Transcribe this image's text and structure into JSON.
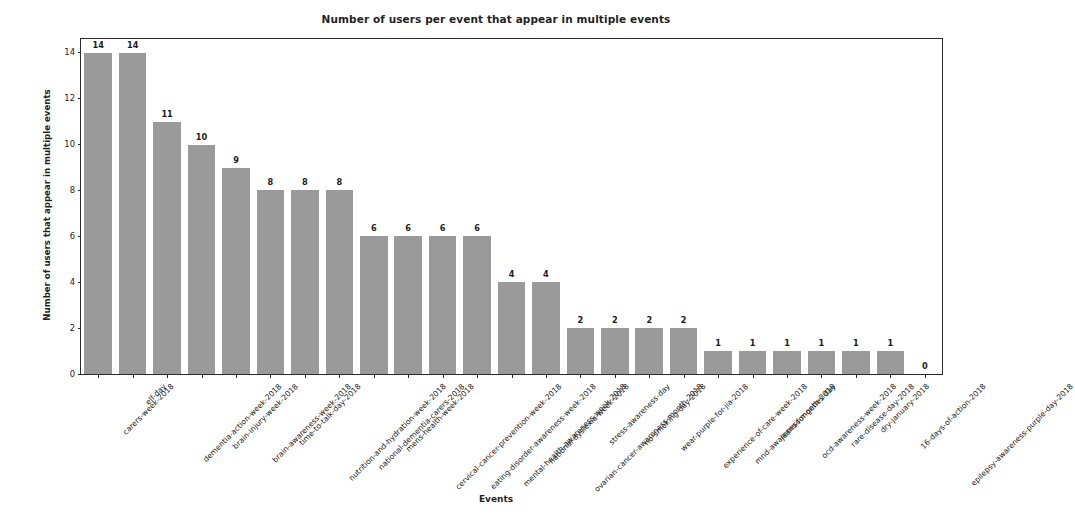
{
  "chart_data": {
    "type": "bar",
    "title": "Number of users per event that appear in multiple events",
    "xlabel": "Events",
    "ylabel": "Number of users that appear in multiple events",
    "ylim": [
      0,
      14.6
    ],
    "yticks": [
      0,
      2,
      4,
      6,
      8,
      10,
      12,
      14
    ],
    "grid": false,
    "legend": null,
    "bar_color": "#9a9a9a",
    "categories": [
      "carers-week-2018",
      "elf-day",
      "dementia-action-week-2018",
      "brain-injury-week-2018",
      "brain-awareness-week-2018",
      "time-to-talk-day-2018",
      "nutrition-and-hydration-week-2018",
      "national-dementia-carers-2018",
      "mens-health-week-2018",
      "cervical-cancer-prevention-week-2018",
      "eating-disorder-awareness-week-2018",
      "mental-health-awareness-week-2018",
      "national-dyslexia-week-2018",
      "ovarian-cancer-awareness-month-2018",
      "stress-awareness-day",
      "no-smoking-day-2018",
      "wear-purple-for-jia-2018",
      "experience-of-care-week-2018",
      "mnd-awareness-month-2018",
      "jeans-for-genes-day",
      "ocd-awareness-week-2018",
      "rare-disease-day-2018",
      "dry-january-2018",
      "16-days-of-action-2018",
      "epilepsy-awareness-purple-day-2018"
    ],
    "values": [
      14,
      14,
      11,
      10,
      9,
      8,
      8,
      8,
      6,
      6,
      6,
      6,
      4,
      4,
      2,
      2,
      2,
      2,
      1,
      1,
      1,
      1,
      1,
      1,
      0
    ],
    "value_labels": [
      "14",
      "14",
      "11",
      "10",
      "9",
      "8",
      "8",
      "8",
      "6",
      "6",
      "6",
      "6",
      "4",
      "4",
      "2",
      "2",
      "2",
      "2",
      "1",
      "1",
      "1",
      "1",
      "1",
      "1",
      "0"
    ]
  }
}
